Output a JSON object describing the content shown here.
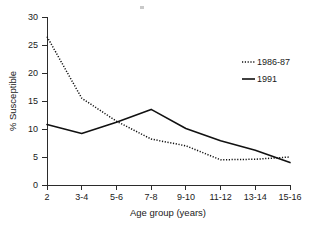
{
  "chart_data": {
    "type": "line",
    "title": "",
    "xlabel": "Age group (years)",
    "ylabel": "% Susceptible",
    "categories": [
      "2",
      "3-4",
      "5-6",
      "7-8",
      "9-10",
      "11-12",
      "13-14",
      "15-16"
    ],
    "ylim": [
      0,
      30
    ],
    "yticks": [
      0,
      5,
      10,
      15,
      20,
      25,
      30
    ],
    "ytick_labels": [
      "0",
      "5",
      "10",
      "15",
      "20",
      "25",
      "30"
    ],
    "grid": false,
    "legend_position": "upper right",
    "series": [
      {
        "name": "1986-87",
        "style": "dotted",
        "color": "#111111",
        "values": [
          26.5,
          15.5,
          11.4,
          8.2,
          7.0,
          4.5,
          4.6,
          5.0
        ]
      },
      {
        "name": "1991",
        "style": "solid",
        "color": "#111111",
        "values": [
          10.8,
          9.2,
          11.2,
          13.5,
          10.1,
          7.9,
          6.2,
          4.0
        ]
      }
    ]
  },
  "axes": {
    "y_axis_label": "% Susceptible",
    "x_axis_label": "Age group (years)"
  },
  "legend": {
    "entries": [
      {
        "label": "1986-87",
        "style": "dotted"
      },
      {
        "label": "1991",
        "style": "solid"
      }
    ]
  }
}
